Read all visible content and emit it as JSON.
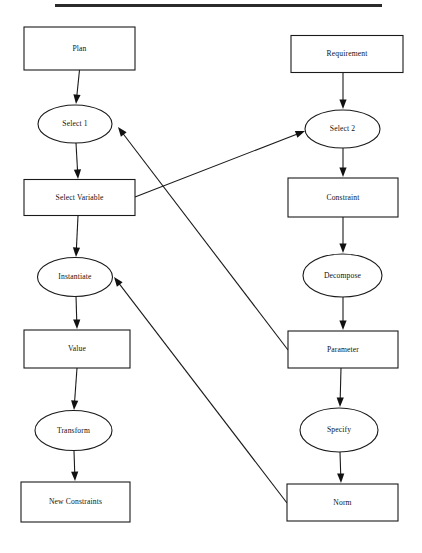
{
  "document": {
    "title": "Flowchart diagram",
    "background_color": "#ffffff",
    "stroke_color": "#1a1a1a",
    "text_color": "#111111"
  },
  "top_rule": {
    "name": "top-horizontal-rule",
    "x": 55,
    "y": 4,
    "width": 327,
    "height": 3,
    "color": "#2b2b2b"
  },
  "nodes": [
    {
      "id": "plan",
      "label": "Plan",
      "shape": "rect",
      "cx": 79.5,
      "cy": 48.5,
      "w": 111,
      "h": 43
    },
    {
      "id": "select1",
      "label": "Select 1",
      "shape": "ellipse",
      "cx": 75,
      "cy": 124,
      "w": 74,
      "h": 38
    },
    {
      "id": "select_variable",
      "label": "Select Variable",
      "shape": "rect",
      "cx": 79.5,
      "cy": 197.5,
      "w": 111,
      "h": 36
    },
    {
      "id": "instantiate",
      "label": "Instantiate",
      "shape": "ellipse",
      "cx": 75,
      "cy": 277,
      "w": 75,
      "h": 39
    },
    {
      "id": "value",
      "label": "Value",
      "shape": "rect",
      "cx": 77,
      "cy": 349,
      "w": 106,
      "h": 38
    },
    {
      "id": "transform",
      "label": "Transform",
      "shape": "ellipse",
      "cx": 73.5,
      "cy": 430.5,
      "w": 77,
      "h": 40
    },
    {
      "id": "new_constraints",
      "label": "New Constraints",
      "shape": "rect",
      "cx": 75.5,
      "cy": 502,
      "w": 109,
      "h": 40
    },
    {
      "id": "requirement",
      "label": "Requirement",
      "shape": "rect",
      "cx": 347,
      "cy": 54,
      "w": 112,
      "h": 37
    },
    {
      "id": "select2",
      "label": "Select 2",
      "shape": "ellipse",
      "cx": 342.5,
      "cy": 129,
      "w": 75,
      "h": 38
    },
    {
      "id": "constraint",
      "label": "Constraint",
      "shape": "rect",
      "cx": 343,
      "cy": 197.5,
      "w": 110,
      "h": 39
    },
    {
      "id": "decompose",
      "label": "Decompose",
      "shape": "ellipse",
      "cx": 342.5,
      "cy": 275.5,
      "w": 79,
      "h": 43
    },
    {
      "id": "parameter",
      "label": "Parameter",
      "shape": "rect",
      "cx": 343,
      "cy": 349.5,
      "w": 110,
      "h": 37
    },
    {
      "id": "specify",
      "label": "Specify",
      "shape": "ellipse",
      "cx": 339,
      "cy": 430,
      "w": 78,
      "h": 44
    },
    {
      "id": "norm",
      "label": "Norm",
      "shape": "rect",
      "cx": 342.5,
      "cy": 502.5,
      "w": 111,
      "h": 37
    }
  ],
  "edges": [
    {
      "id": "plan-to-select1",
      "from": "plan",
      "to": "select1",
      "x1": 79.5,
      "y1": 70,
      "x2": 76,
      "y2": 104,
      "arrow": true
    },
    {
      "id": "select1-to-select-variable",
      "from": "select1",
      "to": "select_variable",
      "x1": 76,
      "y1": 143,
      "x2": 78,
      "y2": 179,
      "arrow": true
    },
    {
      "id": "select-variable-to-instantiate",
      "from": "select_variable",
      "to": "instantiate",
      "x1": 78,
      "y1": 216,
      "x2": 76,
      "y2": 257,
      "arrow": true
    },
    {
      "id": "instantiate-to-value",
      "from": "instantiate",
      "to": "value",
      "x1": 76,
      "y1": 296,
      "x2": 77,
      "y2": 329,
      "arrow": true
    },
    {
      "id": "value-to-transform",
      "from": "value",
      "to": "transform",
      "x1": 77,
      "y1": 368,
      "x2": 74,
      "y2": 410,
      "arrow": true
    },
    {
      "id": "transform-to-new-constraints",
      "from": "transform",
      "to": "new_constraints",
      "x1": 74,
      "y1": 451,
      "x2": 75,
      "y2": 481,
      "arrow": true
    },
    {
      "id": "requirement-to-select2",
      "from": "requirement",
      "to": "select2",
      "x1": 343,
      "y1": 72,
      "x2": 343,
      "y2": 109,
      "arrow": true
    },
    {
      "id": "select2-to-constraint",
      "from": "select2",
      "to": "constraint",
      "x1": 343,
      "y1": 148,
      "x2": 343,
      "y2": 177,
      "arrow": true
    },
    {
      "id": "constraint-to-decompose",
      "from": "constraint",
      "to": "decompose",
      "x1": 343,
      "y1": 217,
      "x2": 343,
      "y2": 253,
      "arrow": true
    },
    {
      "id": "decompose-to-parameter",
      "from": "decompose",
      "to": "parameter",
      "x1": 343,
      "y1": 297,
      "x2": 343,
      "y2": 330,
      "arrow": true
    },
    {
      "id": "parameter-to-specify",
      "from": "parameter",
      "to": "specify",
      "x1": 341,
      "y1": 368,
      "x2": 340,
      "y2": 407,
      "arrow": true
    },
    {
      "id": "specify-to-norm",
      "from": "specify",
      "to": "norm",
      "x1": 340,
      "y1": 452,
      "x2": 341,
      "y2": 483,
      "arrow": true
    },
    {
      "id": "select-variable-to-select2",
      "from": "select_variable",
      "to": "select2",
      "x1": 135,
      "y1": 197,
      "x2": 305,
      "y2": 131,
      "arrow": true
    },
    {
      "id": "select1-from-parameter",
      "from": "parameter",
      "to": "select1",
      "x1": 288,
      "y1": 350,
      "x2": 118,
      "y2": 127,
      "arrow": true
    },
    {
      "id": "instantiate-from-norm",
      "from": "norm",
      "to": "instantiate",
      "x1": 287,
      "y1": 503,
      "x2": 114,
      "y2": 277,
      "arrow": true
    }
  ]
}
